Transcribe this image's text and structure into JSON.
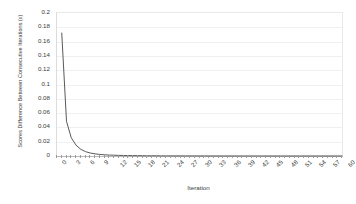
{
  "chart_data": {
    "type": "line",
    "title": "",
    "xlabel": "Iteration",
    "ylabel": "Scores Difference Between Consecutive Iterations (ε)",
    "xlim": [
      0,
      60
    ],
    "ylim": [
      0,
      0.2
    ],
    "grid": true,
    "legend": null,
    "legend_position": "none",
    "line_color": "#595959",
    "y_ticks": [
      0,
      0.02,
      0.04,
      0.06,
      0.08,
      0.1,
      0.12,
      0.14,
      0.16,
      0.18,
      0.2
    ],
    "y_tick_labels": [
      "0",
      "0.02",
      "0.04",
      "0.06",
      "0.08",
      "0.1",
      "0.12",
      "0.14",
      "0.16",
      "0.18",
      "0.2"
    ],
    "x_ticks": [
      0,
      3,
      6,
      9,
      12,
      15,
      18,
      21,
      24,
      27,
      30,
      33,
      36,
      39,
      42,
      45,
      48,
      51,
      54,
      57,
      60
    ],
    "x_tick_labels": [
      "0",
      "3",
      "6",
      "9",
      "12",
      "15",
      "18",
      "21",
      "24",
      "27",
      "30",
      "33",
      "36",
      "39",
      "42",
      "45",
      "48",
      "51",
      "54",
      "57",
      "60"
    ],
    "x_minor_tick_step": 1,
    "series": [
      {
        "name": "epsilon",
        "x": [
          1,
          2,
          3,
          4,
          5,
          6,
          7,
          8,
          9,
          10,
          11,
          12,
          13,
          14,
          15,
          16,
          17,
          18,
          19,
          20,
          21,
          22,
          23,
          24,
          25,
          26,
          27,
          28,
          29,
          30,
          31,
          32,
          33,
          34,
          35,
          36,
          37,
          38,
          39,
          40,
          41,
          42,
          43,
          44,
          45,
          46,
          47,
          48,
          49,
          50,
          51,
          52,
          53,
          54,
          55,
          56,
          57,
          58,
          59,
          60
        ],
        "values": [
          0.172,
          0.0485,
          0.0255,
          0.0152,
          0.0094,
          0.0061,
          0.0042,
          0.003,
          0.0022,
          0.0017,
          0.0013,
          0.0011,
          0.0009,
          0.00075,
          0.00063,
          0.00054,
          0.00046,
          0.0004,
          0.00035,
          0.00031,
          0.00027,
          0.00024,
          0.00021,
          0.00019,
          0.00017,
          0.00015,
          0.00014,
          0.00012,
          0.00011,
          0.0001,
          9e-05,
          8e-05,
          7e-05,
          7e-05,
          6e-05,
          5e-05,
          5e-05,
          4e-05,
          4e-05,
          4e-05,
          3e-05,
          3e-05,
          3e-05,
          2e-05,
          2e-05,
          2e-05,
          2e-05,
          2e-05,
          1e-05,
          1e-05,
          1e-05,
          1e-05,
          1e-05,
          1e-05,
          1e-05,
          1e-05,
          1e-05,
          1e-05,
          1e-05,
          1e-05
        ]
      }
    ]
  }
}
